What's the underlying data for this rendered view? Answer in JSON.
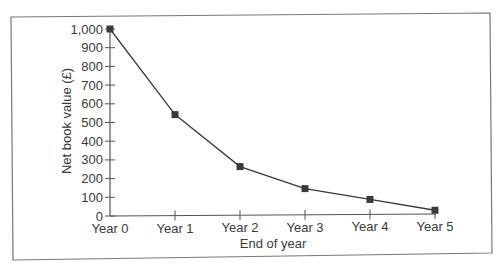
{
  "chart_data": {
    "type": "line",
    "title": "",
    "xlabel": "End of year",
    "ylabel": "Net book value (£)",
    "categories": [
      "Year 0",
      "Year 1",
      "Year 2",
      "Year 3",
      "Year 4",
      "Year 5"
    ],
    "series": [
      {
        "name": "Net book value",
        "values": [
          1000,
          540,
          260,
          140,
          80,
          20
        ],
        "marker": "square",
        "color": "#3a3a3a"
      }
    ],
    "ylim": [
      0,
      1000
    ],
    "yticks": [
      0,
      100,
      200,
      300,
      400,
      500,
      600,
      700,
      800,
      900,
      1000
    ],
    "ytick_labels": [
      "0",
      "100",
      "200",
      "300",
      "400",
      "500",
      "600",
      "700",
      "800",
      "900",
      "1,000"
    ],
    "grid": false,
    "legend": null
  },
  "colors": {
    "line": "#3a3a3a",
    "axis": "#555555",
    "frame": "#777777",
    "text": "#3a3a3a"
  }
}
